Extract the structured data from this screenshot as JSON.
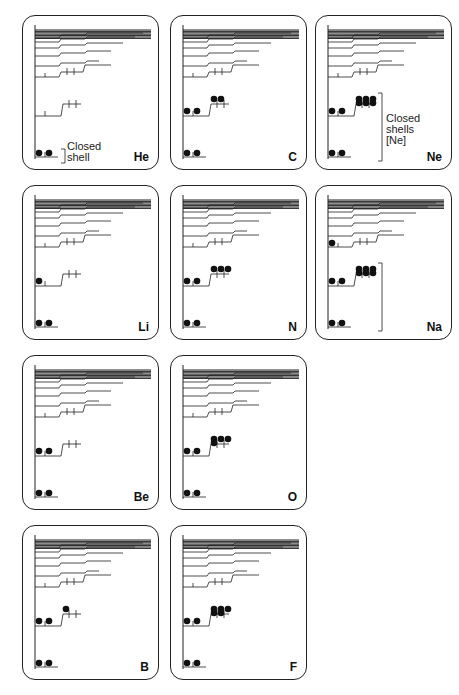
{
  "figure": {
    "panels": [
      {
        "id": "he",
        "symbol": "He",
        "col": 0,
        "row": 0,
        "s1": 2,
        "s2": 0,
        "p2": 0,
        "s3": 0,
        "note": "Closed shell",
        "note_lines": [
          "Closed",
          "shell"
        ]
      },
      {
        "id": "li",
        "symbol": "Li",
        "col": 0,
        "row": 1,
        "s1": 2,
        "s2": 1,
        "p2": 0,
        "s3": 0
      },
      {
        "id": "be",
        "symbol": "Be",
        "col": 0,
        "row": 2,
        "s1": 2,
        "s2": 2,
        "p2": 0,
        "s3": 0
      },
      {
        "id": "b",
        "symbol": "B",
        "col": 0,
        "row": 3,
        "s1": 2,
        "s2": 2,
        "p2": 1,
        "s3": 0
      },
      {
        "id": "c",
        "symbol": "C",
        "col": 1,
        "row": 0,
        "s1": 2,
        "s2": 2,
        "p2": 2,
        "s3": 0
      },
      {
        "id": "n",
        "symbol": "N",
        "col": 1,
        "row": 1,
        "s1": 2,
        "s2": 2,
        "p2": 3,
        "s3": 0
      },
      {
        "id": "o",
        "symbol": "O",
        "col": 1,
        "row": 2,
        "s1": 2,
        "s2": 2,
        "p2": 4,
        "s3": 0
      },
      {
        "id": "f",
        "symbol": "F",
        "col": 1,
        "row": 3,
        "s1": 2,
        "s2": 2,
        "p2": 5,
        "s3": 0
      },
      {
        "id": "ne",
        "symbol": "Ne",
        "col": 2,
        "row": 0,
        "s1": 2,
        "s2": 2,
        "p2": 6,
        "s3": 0,
        "note": "Closed shells [Ne]",
        "note_lines": [
          "Closed",
          "shells",
          "[Ne]"
        ]
      },
      {
        "id": "na",
        "symbol": "Na",
        "col": 2,
        "row": 1,
        "s1": 2,
        "s2": 2,
        "p2": 6,
        "s3": 1
      }
    ]
  },
  "labels": {
    "he_note_1": "Closed",
    "he_note_2": "shell",
    "ne_note_1": "Closed",
    "ne_note_2": "shells",
    "ne_note_3": "[Ne]",
    "symbols": {
      "he": "He",
      "li": "Li",
      "be": "Be",
      "b": "B",
      "c": "C",
      "n": "N",
      "o": "O",
      "f": "F",
      "ne": "Ne",
      "na": "Na"
    }
  },
  "colors": {
    "line": "#222222",
    "electron": "#111111",
    "frame": "#222222"
  }
}
